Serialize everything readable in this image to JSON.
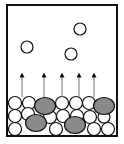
{
  "diagram": {
    "colors": {
      "background": "#ffffff",
      "stroke": "#111111",
      "solvent_fill": "#ffffff",
      "solute_fill": "#8a8a8a",
      "arrow": "#777777",
      "arrowhead": "#111111"
    },
    "container": {
      "x": 7,
      "y": 5,
      "width": 110,
      "height": 131,
      "stroke_width": 2
    },
    "vapor_particles": [
      {
        "cx": 80,
        "cy": 29,
        "r": 6
      },
      {
        "cx": 27,
        "cy": 47,
        "r": 6
      },
      {
        "cx": 71,
        "cy": 54,
        "r": 6
      }
    ],
    "arrows": [
      {
        "x": 22,
        "y1": 97,
        "y2": 75
      },
      {
        "x": 44,
        "y1": 97,
        "y2": 75
      },
      {
        "x": 62,
        "y1": 97,
        "y2": 75
      },
      {
        "x": 79,
        "y1": 97,
        "y2": 75
      },
      {
        "x": 94,
        "y1": 97,
        "y2": 75
      }
    ],
    "solvent_particles": [
      {
        "cx": 15,
        "cy": 103,
        "r": 6.5
      },
      {
        "cx": 29,
        "cy": 103,
        "r": 6.5
      },
      {
        "cx": 62,
        "cy": 103,
        "r": 6.5
      },
      {
        "cx": 76,
        "cy": 103,
        "r": 6.5
      },
      {
        "cx": 89,
        "cy": 103,
        "r": 6.5
      },
      {
        "cx": 15,
        "cy": 116,
        "r": 6.5
      },
      {
        "cx": 28,
        "cy": 114,
        "r": 6.5
      },
      {
        "cx": 50,
        "cy": 117,
        "r": 6.5
      },
      {
        "cx": 63,
        "cy": 116,
        "r": 6.5
      },
      {
        "cx": 77,
        "cy": 116,
        "r": 6.5
      },
      {
        "cx": 90,
        "cy": 117,
        "r": 6.5
      },
      {
        "cx": 104,
        "cy": 117,
        "r": 6
      },
      {
        "cx": 15,
        "cy": 129,
        "r": 6.5
      },
      {
        "cx": 56,
        "cy": 129,
        "r": 6.5
      },
      {
        "cx": 94,
        "cy": 129,
        "r": 6.5
      },
      {
        "cx": 108,
        "cy": 129,
        "r": 6.5
      }
    ],
    "solute_particles": [
      {
        "cx": 45,
        "cy": 106,
        "rx": 10.5,
        "ry": 8.5
      },
      {
        "cx": 104,
        "cy": 106,
        "rx": 10.5,
        "ry": 8.5
      },
      {
        "cx": 36,
        "cy": 123,
        "rx": 10.5,
        "ry": 8.5
      },
      {
        "cx": 75,
        "cy": 125,
        "rx": 10.5,
        "ry": 8.5
      }
    ]
  }
}
